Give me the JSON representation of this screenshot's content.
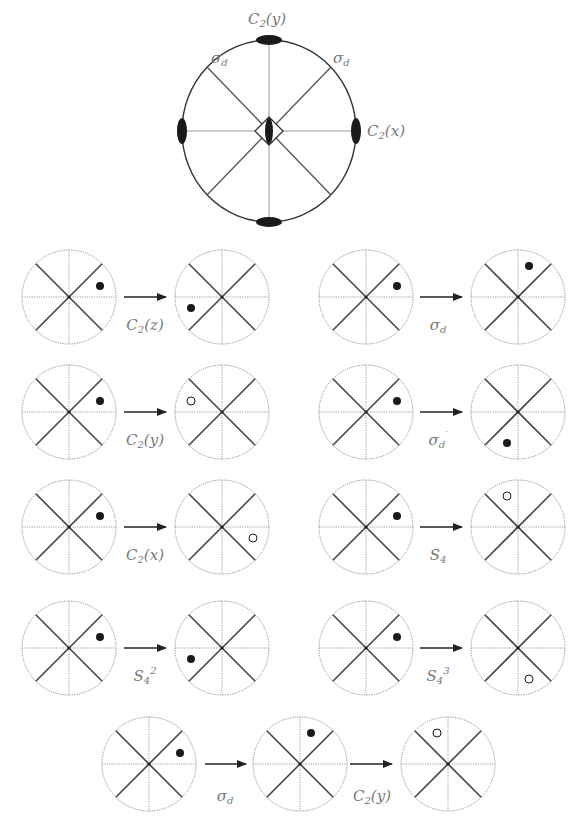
{
  "main_diagram": {
    "title": "D2d symmetry elements (stereographic projection)",
    "center": [
      269,
      131
    ],
    "radius_x": 87,
    "radius_y": 91,
    "labels": {
      "top": {
        "base": "C",
        "sub": "2",
        "arg": "(y)"
      },
      "right": {
        "base": "C",
        "sub": "2",
        "arg": "(x)"
      },
      "sigma_d": {
        "base": "σ",
        "sub": "d",
        "prime": ""
      },
      "sigma_d_prime": {
        "base": "σ",
        "sub": "d",
        "prime": "′"
      }
    },
    "elements": [
      "C2(y) axis (top/bottom)",
      "C2(x) axis (left/right)",
      "S4 axis (center)",
      "σd plane",
      "σd′ plane"
    ]
  },
  "operations": [
    {
      "id": "C2z",
      "label_base": "C",
      "label_sub": "2",
      "label_arg": "(z)",
      "start_dot": {
        "dx": 31,
        "dy": -11,
        "filled": true
      },
      "result_dot": {
        "dx": -31,
        "dy": 11,
        "filled": true
      }
    },
    {
      "id": "sigma_d",
      "label_base": "σ",
      "label_sub": "d",
      "label_arg": "",
      "start_dot": {
        "dx": 31,
        "dy": -11,
        "filled": true
      },
      "result_dot": {
        "dx": 11,
        "dy": -31,
        "filled": true
      }
    },
    {
      "id": "C2y",
      "label_base": "C",
      "label_sub": "2",
      "label_arg": "(y)",
      "start_dot": {
        "dx": 31,
        "dy": -11,
        "filled": true
      },
      "result_dot": {
        "dx": -31,
        "dy": -11,
        "filled": false
      }
    },
    {
      "id": "sigma_d_prime",
      "label_base": "σ",
      "label_sub": "d",
      "label_arg": "′",
      "start_dot": {
        "dx": 31,
        "dy": -11,
        "filled": true
      },
      "result_dot": {
        "dx": -11,
        "dy": 31,
        "filled": true
      }
    },
    {
      "id": "C2x",
      "label_base": "C",
      "label_sub": "2",
      "label_arg": "(x)",
      "start_dot": {
        "dx": 31,
        "dy": -11,
        "filled": true
      },
      "result_dot": {
        "dx": 31,
        "dy": 11,
        "filled": false
      }
    },
    {
      "id": "S4",
      "label_base": "S",
      "label_sub": "4",
      "label_arg": "",
      "start_dot": {
        "dx": 31,
        "dy": -11,
        "filled": true
      },
      "result_dot": {
        "dx": -11,
        "dy": -31,
        "filled": false
      }
    },
    {
      "id": "S4_2",
      "label_base": "S",
      "label_sub": "4",
      "label_arg": "2",
      "start_dot": {
        "dx": 31,
        "dy": -11,
        "filled": true
      },
      "result_dot": {
        "dx": -31,
        "dy": 11,
        "filled": true
      }
    },
    {
      "id": "S4_3",
      "label_base": "S",
      "label_sub": "4",
      "label_arg": "3",
      "start_dot": {
        "dx": 31,
        "dy": -11,
        "filled": true
      },
      "result_dot": {
        "dx": 11,
        "dy": 31,
        "filled": false
      }
    }
  ],
  "composite": {
    "steps": [
      {
        "label_base": "σ",
        "label_sub": "d",
        "label_arg": ""
      },
      {
        "label_base": "C",
        "label_sub": "2",
        "label_arg": "(y)"
      }
    ],
    "dots": [
      {
        "dx": 31,
        "dy": -11,
        "filled": true
      },
      {
        "dx": 11,
        "dy": -31,
        "filled": true
      },
      {
        "dx": -11,
        "dy": -31,
        "filled": false
      }
    ]
  },
  "colors": {
    "circle_outline": "#8a8a8a",
    "axis_lines": "#9a9a9a",
    "diagonal_lines": "#444444",
    "dot": "#1a1a1a",
    "label": "#777777",
    "arrow": "#222222"
  }
}
